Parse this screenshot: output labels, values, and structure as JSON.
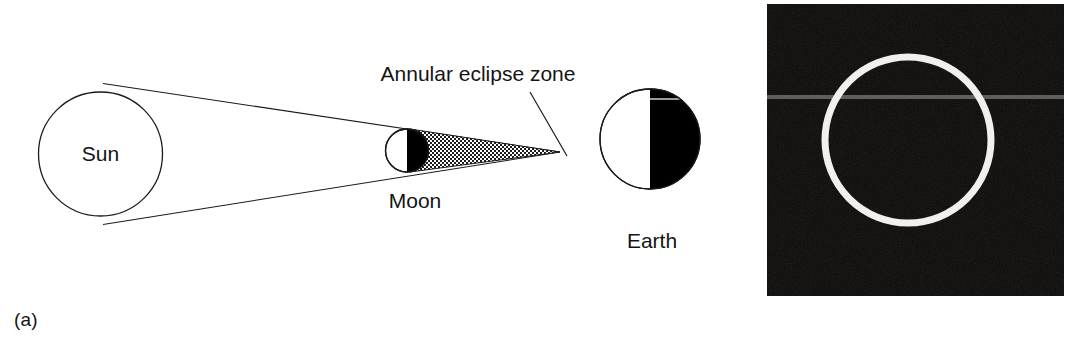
{
  "figure": {
    "caption_style": "two-panel scientific figure",
    "panels": [
      {
        "key": "a",
        "label": "(a)",
        "type": "schematic"
      },
      {
        "key": "b",
        "label": "(b)",
        "type": "photograph"
      }
    ]
  },
  "panel_a": {
    "label": "(a)",
    "title": "Annular solar eclipse geometry",
    "bodies": [
      {
        "name": "sun",
        "label": "Sun",
        "shading": "outline-only"
      },
      {
        "name": "moon",
        "label": "Moon",
        "shading": "right-half-black"
      },
      {
        "name": "earth",
        "label": "Earth",
        "shading": "right-half-black"
      }
    ],
    "sun_label": "Sun",
    "moon_label": "Moon",
    "earth_label": "Earth",
    "zone_label": "Annular eclipse zone",
    "shadow_region_name": "antumbra",
    "shadow_fill": "stippled-dot-pattern",
    "umbra_fill": "#000000",
    "line_color": "#1a1a1a",
    "background": "#ffffff"
  },
  "panel_b": {
    "label": "(b)",
    "description": "Photograph of an annular eclipse ring of fire",
    "ring_color": "#f2f0ec",
    "sky_color": "#0c0a09",
    "scanline_color": "#6d6a66"
  },
  "colors": {
    "ink": "#141414",
    "paper": "#ffffff",
    "black_fill": "#000000",
    "stipple": "#1a1a1a"
  }
}
